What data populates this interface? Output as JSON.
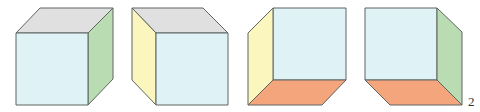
{
  "figure": {
    "label": "2",
    "colors": {
      "front": "#dff3f6",
      "top": "#dfe0df",
      "right_side": "#b9dcb3",
      "left_side": "#fbf6be",
      "bottom": "#f4a57c",
      "outline": "#5f6462"
    },
    "cubes": [
      {
        "name": "cube-1",
        "visible_faces": [
          "front",
          "top",
          "right"
        ]
      },
      {
        "name": "cube-2",
        "visible_faces": [
          "front",
          "top",
          "left"
        ]
      },
      {
        "name": "cube-3",
        "visible_faces": [
          "back",
          "left",
          "bottom"
        ]
      },
      {
        "name": "cube-4",
        "visible_faces": [
          "back",
          "right",
          "bottom"
        ]
      }
    ]
  }
}
